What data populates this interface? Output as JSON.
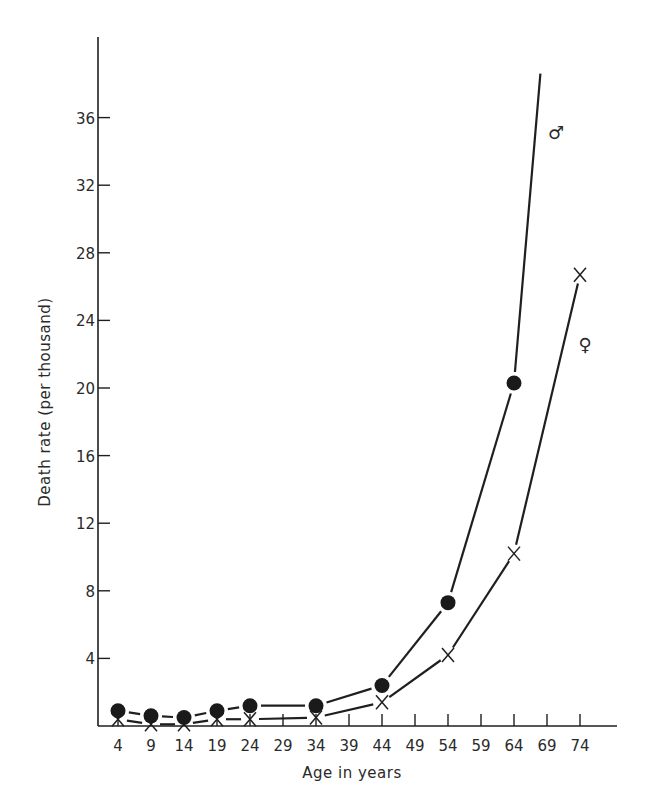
{
  "chart_data": {
    "type": "line",
    "title": "",
    "xlabel": "Age in years",
    "ylabel": "Death rate (per thousand)",
    "x_ticks": [
      4,
      9,
      14,
      19,
      24,
      29,
      34,
      39,
      44,
      49,
      54,
      59,
      64,
      69,
      74
    ],
    "y_ticks": [
      4,
      8,
      12,
      16,
      20,
      24,
      28,
      32,
      36
    ],
    "ylim": [
      0,
      40
    ],
    "xlim": [
      0,
      80
    ],
    "grid": false,
    "legend": "inline symbols at line ends",
    "series": [
      {
        "name": "Male",
        "symbol_label": "♂",
        "marker": "filled-circle",
        "x": [
          4,
          9,
          14,
          19,
          24,
          34,
          44,
          54,
          64
        ],
        "values": [
          0.9,
          0.6,
          0.5,
          0.9,
          1.2,
          1.2,
          2.4,
          7.3,
          20.3
        ],
        "line_extends_to": {
          "x": 68,
          "y": 38.6
        }
      },
      {
        "name": "Female",
        "symbol_label": "♀",
        "marker": "x",
        "x": [
          4,
          9,
          14,
          19,
          24,
          34,
          44,
          54,
          64,
          74
        ],
        "values": [
          0.4,
          0.1,
          0.1,
          0.4,
          0.4,
          0.5,
          1.4,
          4.2,
          10.2,
          26.7
        ]
      }
    ]
  }
}
